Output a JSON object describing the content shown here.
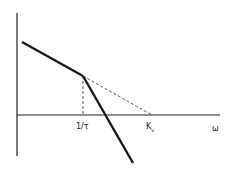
{
  "diagram": {
    "type": "asymptotic-bode-magnitude",
    "labels": {
      "break_frequency": "1/τ",
      "crossover": "K",
      "crossover_sub": "v",
      "x_axis": "ω"
    },
    "colors": {
      "line": "#1a1a1a",
      "background": "#ffffff"
    }
  }
}
